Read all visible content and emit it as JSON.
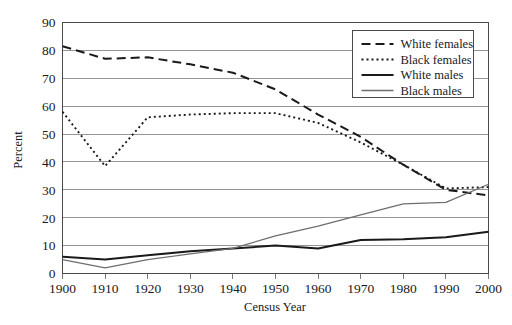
{
  "chart_data": {
    "type": "line",
    "title": "",
    "xlabel": "Census Year",
    "ylabel": "Percent",
    "x": [
      1900,
      1910,
      1920,
      1930,
      1940,
      1950,
      1960,
      1970,
      1980,
      1990,
      2000
    ],
    "xtick_labels": [
      "1900",
      "1910",
      "1920",
      "1930",
      "1940",
      "1950",
      "1960",
      "1970",
      "1980",
      "1990",
      "2000"
    ],
    "ytick_labels": [
      "0",
      "10",
      "20",
      "30",
      "40",
      "50",
      "60",
      "70",
      "80",
      "90"
    ],
    "xlim": [
      1900,
      2000
    ],
    "ylim": [
      0,
      90
    ],
    "grid": "horizontal",
    "legend_position": "top-right",
    "series": [
      {
        "name": "White females",
        "style": "dashed",
        "color": "#1a1a1a",
        "width": 2.0,
        "dash": "9,5",
        "values": [
          81.5,
          77.0,
          77.5,
          75.0,
          72.0,
          66.0,
          57.0,
          49.0,
          39.0,
          30.0,
          28.0
        ]
      },
      {
        "name": "Black females",
        "style": "dotted",
        "color": "#1a1a1a",
        "width": 1.9,
        "dash": "2,3",
        "values": [
          58.0,
          38.5,
          56.0,
          57.0,
          57.5,
          57.5,
          54.0,
          47.0,
          39.0,
          30.5,
          31.0
        ]
      },
      {
        "name": "White males",
        "style": "solid",
        "color": "#1a1a1a",
        "width": 2.0,
        "dash": "none",
        "values": [
          6.0,
          5.0,
          6.5,
          8.0,
          9.0,
          10.0,
          9.0,
          12.0,
          12.3,
          13.0,
          15.0
        ]
      },
      {
        "name": "Black males",
        "style": "solid-thin",
        "color": "#6e6e6e",
        "width": 1.3,
        "dash": "none",
        "values": [
          5.0,
          2.0,
          5.0,
          7.0,
          9.0,
          13.5,
          17.0,
          21.0,
          25.0,
          25.5,
          32.0
        ]
      }
    ]
  },
  "legend": {
    "entries": [
      {
        "label": "White females"
      },
      {
        "label": "Black females"
      },
      {
        "label": "White males"
      },
      {
        "label": "Black males"
      }
    ]
  },
  "axes": {
    "y_title": "Percent",
    "x_title": "Census Year"
  }
}
